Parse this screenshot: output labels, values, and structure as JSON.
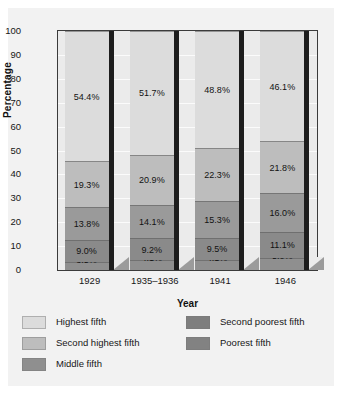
{
  "chart_data": {
    "type": "bar",
    "subtype": "stacked-column",
    "title": "",
    "xlabel": "Year",
    "ylabel": "Percentage",
    "ylim": [
      0,
      100
    ],
    "ytick_step": 10,
    "yticks": [
      "100",
      "90",
      "80",
      "70",
      "60",
      "50",
      "40",
      "30",
      "20",
      "10",
      "0"
    ],
    "categories": [
      "1929",
      "1935–1936",
      "1941",
      "1946"
    ],
    "grid": true,
    "legend_position": "bottom",
    "stack_order_bottom_to_top": [
      "Poorest fifth",
      "Second poorest fifth",
      "Middle fifth",
      "Second highest fifth",
      "Highest fifth"
    ],
    "series": [
      {
        "name": "Highest fifth",
        "color": "#dcdcdc",
        "values": [
          54.4,
          51.7,
          48.8,
          46.1
        ],
        "labels": [
          "54.4%",
          "51.7%",
          "48.8%",
          "46.1%"
        ]
      },
      {
        "name": "Second highest fifth",
        "color": "#bdbdbd",
        "values": [
          19.3,
          20.9,
          22.3,
          21.8
        ],
        "labels": [
          "19.3%",
          "20.9%",
          "22.3%",
          "21.8%"
        ]
      },
      {
        "name": "Middle fifth",
        "color": "#9a9a9a",
        "values": [
          13.8,
          14.1,
          15.3,
          16.0
        ],
        "labels": [
          "13.8%",
          "14.1%",
          "15.3%",
          "16.0%"
        ]
      },
      {
        "name": "Second poorest fifth",
        "color": "#8a8a8a",
        "values": [
          9.0,
          9.2,
          9.5,
          11.1
        ],
        "labels": [
          "9.0%",
          "9.2%",
          "9.5%",
          "11.1%"
        ]
      },
      {
        "name": "Poorest fifth",
        "color": "#8f8f8f",
        "values": [
          3.5,
          4.1,
          4.1,
          5.0
        ],
        "labels": [
          "3.5%",
          "4.1%",
          "4.1%",
          "5.0%"
        ]
      }
    ]
  },
  "legend": {
    "left_column": [
      {
        "label": "Highest fifth",
        "color": "#dcdcdc"
      },
      {
        "label": "Second highest fifth",
        "color": "#bdbdbd"
      },
      {
        "label": "Middle fifth",
        "color": "#8f8f8f"
      }
    ],
    "right_column": [
      {
        "label": "Second poorest fifth",
        "color": "#7e7e7e"
      },
      {
        "label": "Poorest fifth",
        "color": "#828282"
      }
    ]
  },
  "colors": {
    "figure_background": "#f2f2f2",
    "plot_background": "#ebebeb",
    "axis_line": "#3b3b3b",
    "gridline": "#fbfbfb",
    "text": "#161616",
    "bar_edge_shadow": "#1d1d1d",
    "drop_shadow": "#9b9b9b"
  }
}
